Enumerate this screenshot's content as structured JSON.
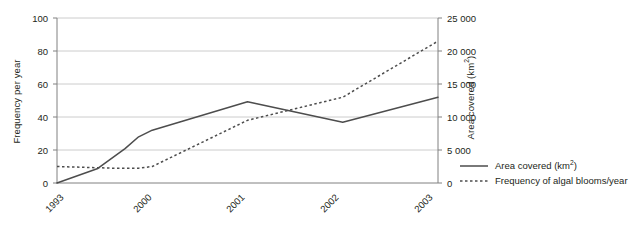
{
  "chart_data": {
    "type": "line",
    "title": "",
    "xlabel": "",
    "categories": [
      "1993",
      "2000",
      "2001",
      "2002",
      "2003"
    ],
    "grid": true,
    "legend_position": "bottom-right",
    "axes": {
      "left": {
        "label": "Frequency per year",
        "ticks": [
          "0",
          "20",
          "40",
          "60",
          "80",
          "100"
        ],
        "lim": [
          0,
          100
        ]
      },
      "right": {
        "label_text": "Area covered (km",
        "label_sup": "2",
        "label_tail": ")",
        "label": "Area covered (km2)",
        "ticks": [
          "0",
          "5 000",
          "10 000",
          "15 000",
          "20 000",
          "25 000"
        ],
        "lim": [
          0,
          25000
        ]
      }
    },
    "series": [
      {
        "name": "Area covered (km2)",
        "legend_text": "Area covered (km",
        "legend_sup": "2",
        "legend_tail": ")",
        "axis": "right",
        "style": "solid",
        "color": "#4d4d4d",
        "values": [
          0,
          8000,
          12300,
          9200,
          13000
        ],
        "vertices": [
          {
            "x": "1993",
            "y": 0
          },
          {
            "x": "1996",
            "y": 2200
          },
          {
            "x": "1998",
            "y": 5200
          },
          {
            "x": "1999",
            "y": 7000
          },
          {
            "x": "2000",
            "y": 8000
          },
          {
            "x": "2001",
            "y": 12300
          },
          {
            "x": "2002",
            "y": 9200
          },
          {
            "x": "2003",
            "y": 13000
          }
        ]
      },
      {
        "name": "Frequency of algal blooms/year",
        "legend_text": "Frequency of algal blooms/year",
        "axis": "left",
        "style": "dotted",
        "color": "#4d4d4d",
        "values": [
          10,
          10,
          38,
          52,
          86
        ],
        "vertices": [
          {
            "x": "1993",
            "y": 10
          },
          {
            "x": "1997",
            "y": 9
          },
          {
            "x": "1999",
            "y": 9
          },
          {
            "x": "2000",
            "y": 10
          },
          {
            "x": "2001",
            "y": 38
          },
          {
            "x": "2002",
            "y": 52
          },
          {
            "x": "2003",
            "y": 86
          }
        ]
      }
    ]
  },
  "colors": {
    "axis": "#808080",
    "grid": "#cccccc",
    "line": "#4d4d4d",
    "text": "#231f20"
  }
}
